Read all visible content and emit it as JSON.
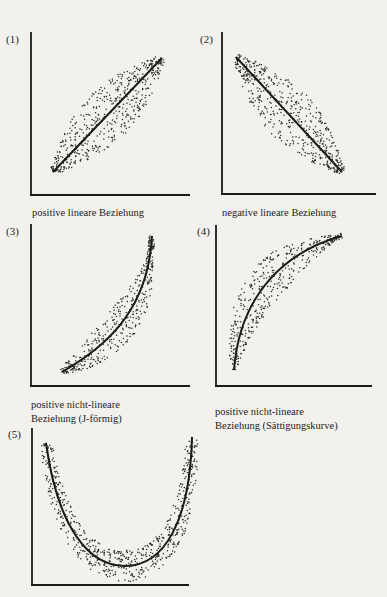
{
  "chart_data": [
    {
      "type": "scatter",
      "id": "1",
      "number_label": "(1)",
      "title": "positive lineare Beziehung",
      "trend": "linear increasing",
      "xlabel": "",
      "ylabel": "",
      "grid": false,
      "line": {
        "x": [
          0,
          1
        ],
        "y": [
          0,
          1
        ]
      }
    },
    {
      "type": "scatter",
      "id": "2",
      "number_label": "(2)",
      "title": "negative lineare Beziehung",
      "trend": "linear decreasing",
      "xlabel": "",
      "ylabel": "",
      "grid": false,
      "line": {
        "x": [
          0,
          1
        ],
        "y": [
          1,
          0
        ]
      }
    },
    {
      "type": "scatter",
      "id": "3",
      "number_label": "(3)",
      "title": "positive nicht-lineare Beziehung (J-förmig)",
      "title_lines": [
        "positive nicht-lineare",
        "Beziehung (J-förmig)"
      ],
      "trend": "convex increasing (J-shaped)",
      "xlabel": "",
      "ylabel": "",
      "grid": false
    },
    {
      "type": "scatter",
      "id": "4",
      "number_label": "(4)",
      "title": "positive nicht-lineare Beziehung (Sättigungskurve)",
      "title_lines": [
        "positive nicht-lineare",
        "Beziehung (Sättigungskurve)"
      ],
      "trend": "concave increasing (saturation curve)",
      "xlabel": "",
      "ylabel": "",
      "grid": false
    },
    {
      "type": "scatter",
      "id": "5",
      "number_label": "(5)",
      "title": "",
      "trend": "U-shaped",
      "xlabel": "",
      "ylabel": "",
      "grid": false
    }
  ],
  "labels": {
    "c1": {
      "num": "(1)",
      "line1": "positive lineare Beziehung"
    },
    "c2": {
      "num": "(2)",
      "line1": "negative lineare Beziehung"
    },
    "c3": {
      "num": "(3)",
      "line1": "positive nicht-lineare",
      "line2": "Beziehung (J-förmig)"
    },
    "c4": {
      "num": "(4)",
      "line1": "positive nicht-lineare",
      "line2": "Beziehung (Sättigungskurve)"
    },
    "c5": {
      "num": "(5)"
    }
  },
  "colors": {
    "ink": "#1a1a1a",
    "paper": "#f2f1ed",
    "dots": "#2a2a2a"
  }
}
